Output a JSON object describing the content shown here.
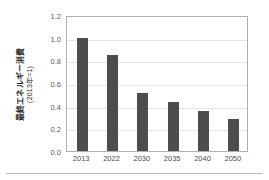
{
  "chart_data": {
    "type": "bar",
    "title": "",
    "xlabel": "",
    "ylabel": "最終エネルギー消費",
    "ylabel_sub": "(2013年=1)",
    "categories": [
      "2013",
      "2022",
      "2030",
      "2035",
      "2040",
      "2050"
    ],
    "values": [
      1.0,
      0.85,
      0.51,
      0.43,
      0.35,
      0.28
    ],
    "ylim": [
      0.0,
      1.2
    ],
    "ytick_labels": [
      "0.0",
      "0.2",
      "0.4",
      "0.6",
      "0.8",
      "1.0",
      "1.2"
    ],
    "ytick_values": [
      0.0,
      0.2,
      0.4,
      0.6,
      0.8,
      1.0,
      1.2
    ],
    "grid": true,
    "legend": null,
    "bar_color": "#4d4d4d",
    "grid_color": "#e4e4e4",
    "frame_color": "#b0b0b0",
    "background": "#ffffff"
  }
}
